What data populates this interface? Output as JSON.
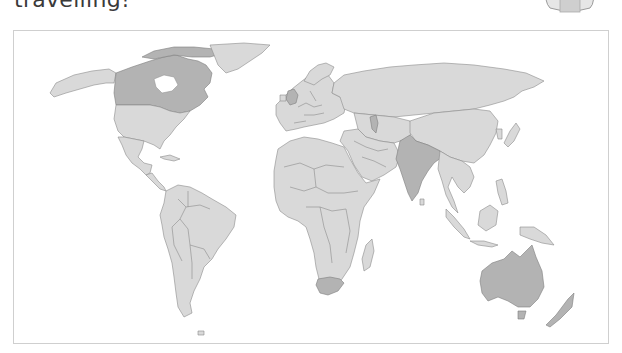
{
  "heading": {
    "text": "travelling!"
  },
  "map": {
    "title": "World map",
    "colors": {
      "land": "#d9d9d9",
      "highlighted": "#b3b3b3",
      "border": "#8c8c8c",
      "frame": "#cfcfcf",
      "background": "#ffffff"
    },
    "highlighted_countries": [
      "Canada",
      "United Kingdom",
      "India",
      "South Africa",
      "Australia",
      "New Zealand"
    ]
  },
  "illustration": {
    "name": "cartoon-character-partial"
  }
}
